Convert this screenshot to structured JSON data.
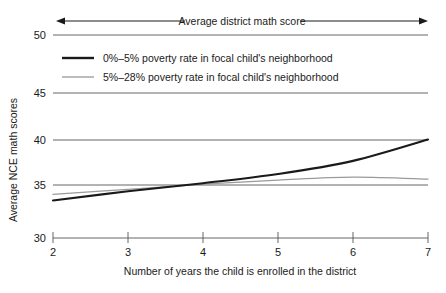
{
  "chart_data": {
    "type": "line",
    "title": "",
    "xlabel": "Number of years the child is enrolled in the district",
    "ylabel": "Average NCE math scores",
    "xlim": [
      2,
      7
    ],
    "ylim": [
      30,
      50
    ],
    "x_ticks": [
      "2",
      "3",
      "4",
      "5",
      "6",
      "7"
    ],
    "y_ticks": [
      "30",
      "35",
      "40",
      "45",
      "50"
    ],
    "grid": "horizontal",
    "legend_position": "upper-left-inside",
    "annotation": "Average district math score",
    "annotation_style": "double-headed-arrow-spanning-plot-width",
    "x": [
      2,
      3,
      4,
      5,
      6,
      7
    ],
    "series": [
      {
        "name": "0%–5% poverty rate in focal child's neighborhood",
        "color": "#1a1a1a",
        "width": 2.1,
        "values": [
          33.7,
          34.6,
          35.4,
          36.3,
          37.6,
          39.7
        ]
      },
      {
        "name": "5%–28% poverty rate in focal child's neighborhood",
        "color": "#9a9a9a",
        "width": 1.2,
        "values": [
          34.3,
          34.8,
          35.3,
          35.7,
          36.0,
          35.8
        ]
      }
    ]
  },
  "axes": {
    "y_label": "Average NCE math scores",
    "x_label": "Number of years the child is enrolled in the district",
    "y_tick_50": "50",
    "y_tick_45": "45",
    "y_tick_40": "40",
    "y_tick_35": "35",
    "y_tick_30": "30",
    "x_tick_2": "2",
    "x_tick_3": "3",
    "x_tick_4": "4",
    "x_tick_5": "5",
    "x_tick_6": "6",
    "x_tick_7": "7"
  },
  "annotation": {
    "label": "Average district math score"
  },
  "legend": {
    "entries": [
      {
        "label": "0%–5% poverty rate in focal child's neighborhood"
      },
      {
        "label": "5%–28% poverty rate in focal child's neighborhood"
      }
    ]
  },
  "colors": {
    "series_dark": "#1a1a1a",
    "series_light": "#9a9a9a",
    "gridline": "#555555",
    "axis": "#555555",
    "background": "#ffffff"
  }
}
